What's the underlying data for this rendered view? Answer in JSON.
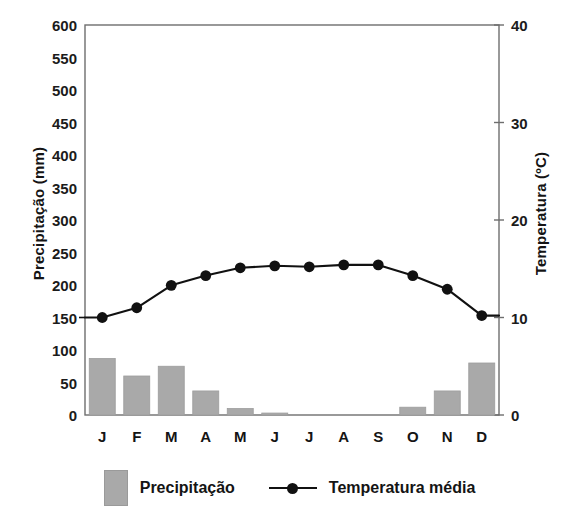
{
  "chart_data": {
    "type": "bar",
    "title": "",
    "categories": [
      "J",
      "F",
      "M",
      "A",
      "M",
      "J",
      "J",
      "A",
      "S",
      "O",
      "N",
      "D"
    ],
    "series": [
      {
        "name": "Precipitação",
        "type": "bar",
        "axis": "left",
        "unit": "mm",
        "color": "#a9a9a9",
        "values": [
          87,
          60,
          75,
          37,
          10,
          3,
          0,
          0,
          0,
          12,
          37,
          80
        ]
      },
      {
        "name": "Temperatura média",
        "type": "line",
        "axis": "right",
        "unit": "ºC",
        "color": "#111111",
        "values": [
          10.0,
          11.0,
          13.3,
          14.3,
          15.1,
          15.3,
          15.2,
          15.4,
          15.4,
          14.3,
          12.9,
          10.2
        ]
      }
    ],
    "ylabel": "Precipitação (mm)",
    "ylabel_right": "Temperatura (ºC)",
    "xlabel": "",
    "ylim": [
      0,
      600
    ],
    "ylim_right": [
      0,
      40
    ],
    "yticks": [
      0,
      50,
      100,
      150,
      200,
      250,
      300,
      350,
      400,
      450,
      500,
      550,
      600
    ],
    "yticks_right": [
      0,
      10,
      20,
      30,
      40
    ],
    "grid": false,
    "legend_position": "bottom"
  },
  "axes": {
    "left": {
      "title": "Precipitação (mm)",
      "ticks": [
        "600",
        "550",
        "500",
        "450",
        "400",
        "350",
        "300",
        "250",
        "200",
        "150",
        "100",
        "50",
        "0"
      ]
    },
    "right": {
      "title": "Temperatura (ºC)",
      "ticks": [
        "40",
        "30",
        "20",
        "10",
        "0"
      ]
    },
    "x": {
      "ticks": [
        "J",
        "F",
        "M",
        "A",
        "M",
        "J",
        "J",
        "A",
        "S",
        "O",
        "N",
        "D"
      ]
    }
  },
  "legend": {
    "precipitation_label": "Precipitação",
    "temperature_label": "Temperatura média"
  },
  "colors": {
    "bar_fill": "#a9a9a9",
    "bar_stroke": "#9d9d9d",
    "line": "#111111",
    "frame": "#6e6e6e",
    "text": "#141414"
  }
}
